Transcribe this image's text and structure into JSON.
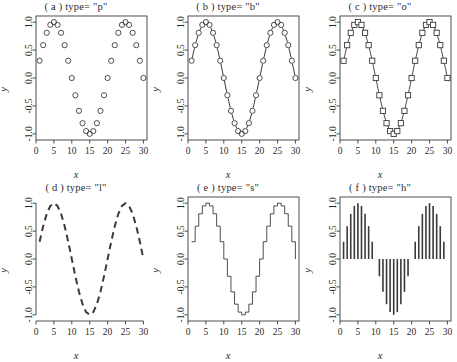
{
  "figure": {
    "width": 457,
    "height": 362,
    "background": "#ffffff",
    "rows": 2,
    "cols": 3,
    "axis_color": "#3a3a3a",
    "data_color": "#3a3a3a"
  },
  "panels": [
    {
      "key": "a",
      "title": "( a )  type= \"p\"",
      "plot_type": "points",
      "marker": "circle-open",
      "line": "none",
      "box": true,
      "xlabel": "x",
      "ylabel": "y"
    },
    {
      "key": "b",
      "title": "( b )  type= \"b\"",
      "plot_type": "both",
      "marker": "circle-open",
      "line": "dashed",
      "box": true,
      "xlabel": "x",
      "ylabel": "y"
    },
    {
      "key": "c",
      "title": "( c )  type= \"o\"",
      "plot_type": "overplotted",
      "marker": "square-open",
      "line": "solid",
      "box": true,
      "xlabel": "x",
      "ylabel": "y"
    },
    {
      "key": "d",
      "title": "( d )  type= \"l\"",
      "plot_type": "line",
      "marker": "none",
      "line": "dashed",
      "box": false,
      "xlabel": "x",
      "ylabel": "y"
    },
    {
      "key": "e",
      "title": "( e )  type= \"s\"",
      "plot_type": "stairstep",
      "marker": "none",
      "line": "solid",
      "box": true,
      "xlabel": "x",
      "ylabel": "y"
    },
    {
      "key": "f",
      "title": "( f )  type= \"h\"",
      "plot_type": "histogram-spikes",
      "marker": "none",
      "line": "solid",
      "box": true,
      "xlabel": "x",
      "ylabel": "y"
    }
  ],
  "chart_data": {
    "type": "line",
    "xlabel": "x",
    "ylabel": "y",
    "grid": false,
    "legend": "none",
    "xlim": [
      0,
      31
    ],
    "ylim": [
      -1.0,
      1.0
    ],
    "xticks": [
      0,
      5,
      10,
      15,
      20,
      25,
      30
    ],
    "xticklabels": [
      "0",
      "5",
      "10",
      "15",
      "20",
      "25",
      "30"
    ],
    "yticks": [
      -1.0,
      -0.5,
      0.0,
      0.5,
      1.0
    ],
    "yticklabels": [
      "-1.0",
      "-0.5",
      "0.0",
      "0.5",
      "1.0"
    ],
    "x": [
      1,
      2,
      3,
      4,
      5,
      6,
      7,
      8,
      9,
      10,
      11,
      12,
      13,
      14,
      15,
      16,
      17,
      18,
      19,
      20,
      21,
      22,
      23,
      24,
      25,
      26,
      27,
      28,
      29,
      30
    ],
    "y": [
      0.309,
      0.588,
      0.809,
      0.951,
      1.0,
      0.951,
      0.809,
      0.588,
      0.309,
      0.0,
      -0.309,
      -0.588,
      -0.809,
      -0.951,
      -1.0,
      -0.951,
      -0.809,
      -0.588,
      -0.309,
      0.0,
      0.309,
      0.588,
      0.809,
      0.951,
      1.0,
      0.951,
      0.809,
      0.588,
      0.309,
      0.0
    ],
    "series": [
      {
        "name": "sin(2*pi*x/20)",
        "values": [
          0.309,
          0.588,
          0.809,
          0.951,
          1.0,
          0.951,
          0.809,
          0.588,
          0.309,
          0.0,
          -0.309,
          -0.588,
          -0.809,
          -0.951,
          -1.0,
          -0.951,
          -0.809,
          -0.588,
          -0.309,
          0.0,
          0.309,
          0.588,
          0.809,
          0.951,
          1.0,
          0.951,
          0.809,
          0.588,
          0.309,
          0.0
        ]
      }
    ]
  }
}
